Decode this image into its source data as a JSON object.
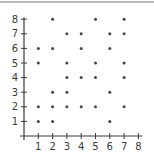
{
  "chart_data": {
    "type": "scatter",
    "title": "",
    "xlabel": "",
    "ylabel": "",
    "xlim": [
      0,
      8
    ],
    "ylim": [
      0,
      8
    ],
    "x_ticks": [
      "1",
      "2",
      "3",
      "4",
      "5",
      "6",
      "7",
      "8"
    ],
    "y_ticks": [
      "1",
      "2",
      "3",
      "4",
      "5",
      "6",
      "7",
      "8"
    ],
    "grid": false,
    "legend": null,
    "points": [
      [
        1,
        6
      ],
      [
        1,
        5
      ],
      [
        1,
        2
      ],
      [
        1,
        1
      ],
      [
        2,
        8
      ],
      [
        2,
        6
      ],
      [
        2,
        3
      ],
      [
        2,
        2
      ],
      [
        2,
        1
      ],
      [
        3,
        7
      ],
      [
        3,
        5
      ],
      [
        3,
        4
      ],
      [
        3,
        3
      ],
      [
        3,
        2
      ],
      [
        4,
        7
      ],
      [
        4,
        6
      ],
      [
        4,
        4
      ],
      [
        4,
        2
      ],
      [
        5,
        8
      ],
      [
        5,
        5
      ],
      [
        5,
        4
      ],
      [
        5,
        2
      ],
      [
        6,
        7
      ],
      [
        6,
        6
      ],
      [
        6,
        3
      ],
      [
        6,
        1
      ],
      [
        7,
        8
      ],
      [
        7,
        7
      ],
      [
        7,
        5
      ],
      [
        7,
        4
      ],
      [
        7,
        2
      ]
    ],
    "colors": {
      "axis": "#3a3a3a",
      "point": "#444444"
    }
  }
}
